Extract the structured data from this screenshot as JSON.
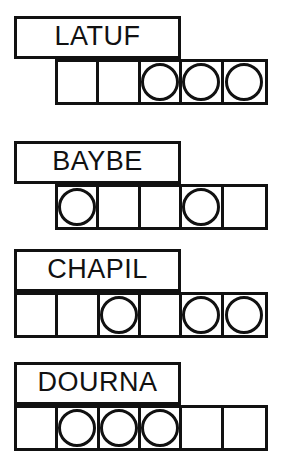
{
  "sheet": {
    "title": "word-shape puzzle worksheet",
    "background_color": "#ffffff",
    "ink_color": "#111111",
    "group_count": 4,
    "cell_count_label": "cells"
  },
  "groups": [
    {
      "id": "latuf",
      "word": "LATUF",
      "letter_count": 5,
      "plaque": {
        "x": 14,
        "y": 16,
        "width": 167,
        "height": 43
      },
      "strip": {
        "x": 55,
        "y": 59,
        "width": 213,
        "height": 46,
        "cells": 5
      },
      "circles": [
        false,
        false,
        true,
        true,
        true
      ],
      "circle_positions": "3,4,5"
    },
    {
      "id": "baybe",
      "word": "BAYBE",
      "letter_count": 5,
      "plaque": {
        "x": 14,
        "y": 141,
        "width": 167,
        "height": 43
      },
      "strip": {
        "x": 55,
        "y": 184,
        "width": 213,
        "height": 46,
        "cells": 5
      },
      "circles": [
        true,
        false,
        false,
        true,
        false
      ],
      "circle_positions": "1,4"
    },
    {
      "id": "chapil",
      "word": "CHAPIL",
      "letter_count": 6,
      "plaque": {
        "x": 14,
        "y": 249,
        "width": 167,
        "height": 43
      },
      "strip": {
        "x": 14,
        "y": 292,
        "width": 254,
        "height": 46,
        "cells": 6
      },
      "circles": [
        false,
        false,
        true,
        false,
        true,
        true
      ],
      "circle_positions": "3,5,6"
    },
    {
      "id": "dourna",
      "word": "DOURNA",
      "letter_count": 6,
      "plaque": {
        "x": 14,
        "y": 362,
        "width": 167,
        "height": 43
      },
      "strip": {
        "x": 14,
        "y": 405,
        "width": 254,
        "height": 46,
        "cells": 6
      },
      "circles": [
        false,
        true,
        true,
        true,
        false,
        false
      ],
      "circle_positions": "2,3,4"
    }
  ]
}
